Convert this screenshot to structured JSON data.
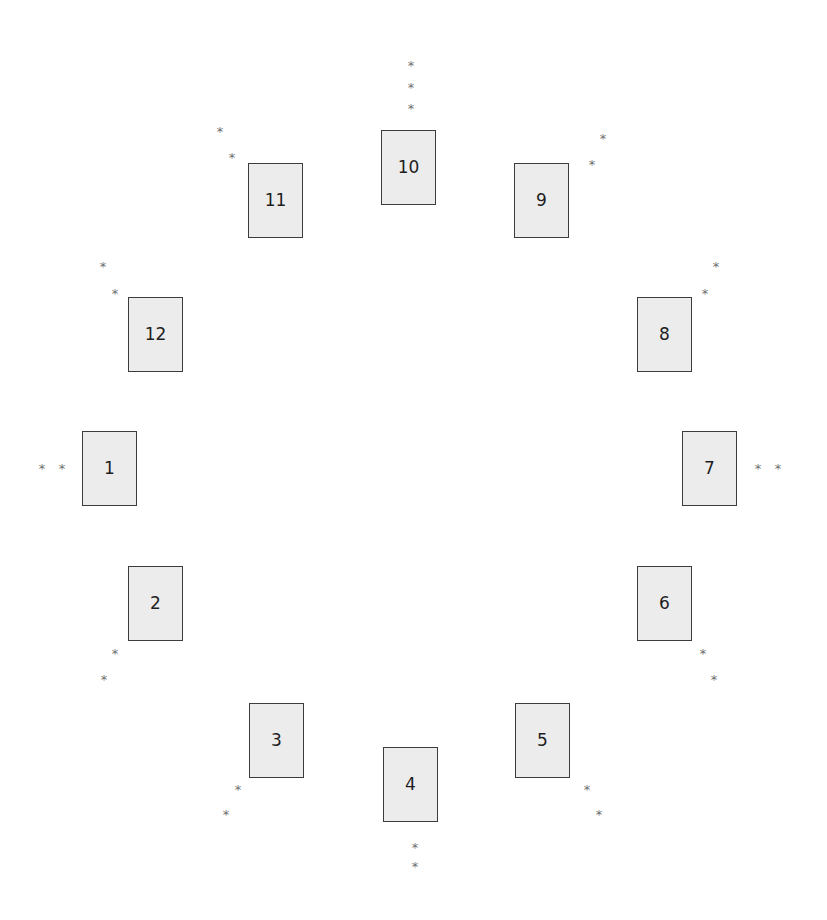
{
  "diagram": {
    "type": "circular-card-layout",
    "colors": {
      "card_fill": "#ececec",
      "card_border": "#3c3c3c",
      "label": "#1e1e1e",
      "marker": "#6e6e6e"
    },
    "marker_glyph": "*",
    "cards": [
      {
        "label": "1",
        "x": 82,
        "y": 431,
        "markers": [
          [
            42,
            466
          ],
          [
            62,
            466
          ]
        ]
      },
      {
        "label": "2",
        "x": 128,
        "y": 566,
        "markers": [
          [
            115,
            651
          ],
          [
            104,
            677
          ]
        ]
      },
      {
        "label": "3",
        "x": 249,
        "y": 703,
        "markers": [
          [
            238,
            787
          ],
          [
            226,
            812
          ]
        ]
      },
      {
        "label": "4",
        "x": 383,
        "y": 747,
        "markers": [
          [
            415,
            845
          ],
          [
            415,
            864
          ]
        ]
      },
      {
        "label": "5",
        "x": 515,
        "y": 703,
        "markers": [
          [
            587,
            787
          ],
          [
            599,
            812
          ]
        ]
      },
      {
        "label": "6",
        "x": 637,
        "y": 566,
        "markers": [
          [
            703,
            651
          ],
          [
            714,
            677
          ]
        ]
      },
      {
        "label": "7",
        "x": 682,
        "y": 431,
        "markers": [
          [
            758,
            466
          ],
          [
            778,
            466
          ]
        ]
      },
      {
        "label": "8",
        "x": 637,
        "y": 297,
        "markers": [
          [
            716,
            264
          ],
          [
            705,
            291
          ]
        ]
      },
      {
        "label": "9",
        "x": 514,
        "y": 163,
        "markers": [
          [
            603,
            136
          ],
          [
            592,
            162
          ]
        ]
      },
      {
        "label": "10",
        "x": 381,
        "y": 130,
        "markers": [
          [
            411,
            63
          ],
          [
            411,
            85
          ],
          [
            411,
            106
          ]
        ]
      },
      {
        "label": "11",
        "x": 248,
        "y": 163,
        "markers": [
          [
            220,
            129
          ],
          [
            232,
            155
          ]
        ]
      },
      {
        "label": "12",
        "x": 128,
        "y": 297,
        "markers": [
          [
            103,
            264
          ],
          [
            115,
            291
          ]
        ]
      }
    ]
  }
}
